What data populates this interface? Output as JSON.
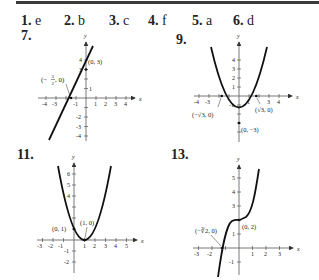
{
  "answers": [
    {
      "num": "1.",
      "value": "e"
    },
    {
      "num": "2.",
      "value": "b"
    },
    {
      "num": "3.",
      "value": "c"
    },
    {
      "num": "4.",
      "value": "f"
    },
    {
      "num": "5.",
      "value": "a"
    },
    {
      "num": "6.",
      "value": "d"
    }
  ],
  "problems": [
    {
      "label": "7.",
      "function": "line",
      "x_ticks": [
        "-4",
        "-3",
        "-1",
        "1",
        "2",
        "3",
        "4"
      ],
      "y_ticks": [
        "4",
        "3",
        "1",
        "-2",
        "-3",
        "-4"
      ],
      "points": [
        "(0, 3)",
        "(-3/2, 0)"
      ],
      "annotations": {
        "p1": "(0, 3)",
        "p2_num": "3",
        "p2_den": "2",
        "p2_suffix": ", 0)"
      }
    },
    {
      "label": "9.",
      "function": "parabola y = x^2 - 3",
      "x_ticks": [
        "-4",
        "-3",
        "1",
        "3",
        "4"
      ],
      "y_ticks": [
        "4",
        "3",
        "2",
        "1",
        "-1"
      ],
      "annotations": {
        "p1": "(−√3, 0)",
        "p2": "(√3, 0)",
        "p3": "(0, −3)"
      }
    },
    {
      "label": "11.",
      "function": "parabola y = (x-1)^2",
      "x_ticks": [
        "-3",
        "-2",
        "-1",
        "1",
        "2",
        "3",
        "4",
        "5"
      ],
      "y_ticks": [
        "6",
        "5",
        "4",
        "-1",
        "-2"
      ],
      "annotations": {
        "p1": "(0, 1)",
        "p2": "(1, 0)"
      }
    },
    {
      "label": "13.",
      "function": "cubic y = x^3 + 2",
      "x_ticks": [
        "-3",
        "-2",
        "1",
        "2",
        "3"
      ],
      "y_ticks": [
        "5",
        "4",
        "3",
        "1",
        "-1"
      ],
      "annotations": {
        "p1": "(−∛2, 0)",
        "p2": "(0, 2)"
      }
    }
  ],
  "axis_labels": {
    "x": "x",
    "y": "y"
  }
}
